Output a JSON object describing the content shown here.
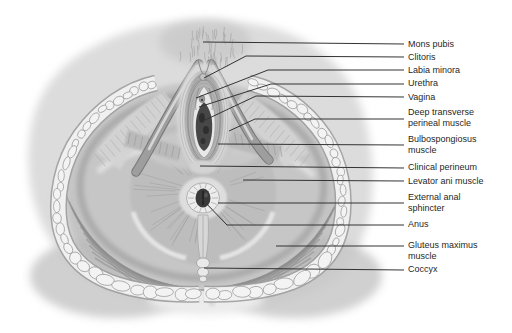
{
  "figure": {
    "title": "",
    "style": "grayscale line-and-wash anatomical illustration"
  },
  "colors": {
    "background": "#ffffff",
    "body_skin": "#dadada",
    "muscle": "#bfbfbf",
    "fat_lobule": "#f3f3f3",
    "outline": "#8f8f8f",
    "dark_opening": "#3f3f3f",
    "leader_line": "#333333",
    "label_text": "#1f1f1f"
  },
  "labels": [
    {
      "text": "Mons pubis"
    },
    {
      "text": "Clitoris"
    },
    {
      "text": "Labia minora"
    },
    {
      "text": "Urethra"
    },
    {
      "text": "Vagina"
    },
    {
      "text": "Deep transverse",
      "text2": "perineal muscle"
    },
    {
      "text": "Bulbospongiosus",
      "text2": "muscle"
    },
    {
      "text": "Clinical perineum"
    },
    {
      "text": "Levator ani muscle"
    },
    {
      "text": "External anal",
      "text2": "sphincter"
    },
    {
      "text": "Anus"
    },
    {
      "text": "Gluteus maximus",
      "text2": "muscle"
    },
    {
      "text": "Coccyx"
    }
  ]
}
